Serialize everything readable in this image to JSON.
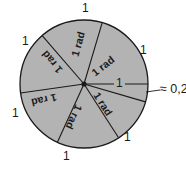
{
  "figure": {
    "colors": {
      "sector_fill": "#b3b3b3",
      "outline": "#1a1a1a",
      "text": "#1a1a1a",
      "background": "#ffffff"
    },
    "circle": {
      "center_x": 84,
      "center_y": 84,
      "radius": 64
    },
    "remainder_label": "≈ 0,28",
    "sectors": [
      {
        "id": "sector-1",
        "label": "1 rad",
        "angle_rad": 1,
        "text_x": 78,
        "text_y": 44,
        "rotation": -75
      },
      {
        "id": "sector-2",
        "label": "1 rad",
        "angle_rad": 1,
        "text_x": 52,
        "text_y": 62,
        "rotation": -130
      },
      {
        "id": "sector-3",
        "label": "1 rad",
        "angle_rad": 1,
        "text_x": 44,
        "text_y": 100,
        "rotation": 167
      },
      {
        "id": "sector-4",
        "label": "1 rad",
        "angle_rad": 1,
        "text_x": 74,
        "text_y": 117,
        "rotation": 114
      },
      {
        "id": "sector-5",
        "label": "1 rad",
        "angle_rad": 1,
        "text_x": 103,
        "text_y": 104,
        "rotation": 57
      },
      {
        "id": "sector-6",
        "label": "1 rad",
        "angle_rad": 1,
        "text_x": 103,
        "text_y": 66,
        "rotation": -38
      },
      {
        "id": "sector-7",
        "label": "≈ 0,28",
        "angle_rad": 0.28,
        "text_x": 0,
        "text_y": 0,
        "rotation": 0
      }
    ],
    "arc_labels": [
      {
        "id": "arc-label-top",
        "value": "1",
        "x": 82,
        "y": 2
      },
      {
        "id": "arc-label-upper-left",
        "value": "1",
        "x": 22,
        "y": 35
      },
      {
        "id": "arc-label-lower-left",
        "value": "1",
        "x": 12,
        "y": 107
      },
      {
        "id": "arc-label-bottom",
        "value": "1",
        "x": 63,
        "y": 150
      },
      {
        "id": "arc-label-lower-right",
        "value": "1",
        "x": 124,
        "y": 131
      },
      {
        "id": "arc-label-upper-right",
        "value": "1",
        "x": 140,
        "y": 44
      }
    ],
    "radius_label": {
      "id": "radius-label",
      "value": "1",
      "x": 114,
      "y": 77
    }
  }
}
